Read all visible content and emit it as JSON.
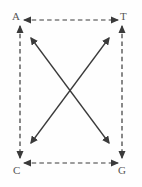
{
  "figure": {
    "width": 142,
    "height": 187,
    "background_color": "#fefefe",
    "stroke_color": "#3a3a3a",
    "label_color": "#555555"
  },
  "nodes": [
    {
      "id": "a",
      "label": "A",
      "position": "top-left",
      "x": 20,
      "y": 24
    },
    {
      "id": "t",
      "label": "T",
      "position": "top-right",
      "x": 122,
      "y": 24
    },
    {
      "id": "c",
      "label": "C",
      "position": "bottom-left",
      "x": 20,
      "y": 161
    },
    {
      "id": "g",
      "label": "G",
      "position": "bottom-right",
      "x": 122,
      "y": 161
    }
  ],
  "edges": [
    {
      "id": "edge-top",
      "from": "a",
      "to": "t",
      "style": "dashed",
      "arrowheads": "both",
      "x1": 24,
      "y1": 20,
      "x2": 118,
      "y2": 20
    },
    {
      "id": "edge-bottom",
      "from": "c",
      "to": "g",
      "style": "dashed",
      "arrowheads": "both",
      "x1": 24,
      "y1": 163,
      "x2": 118,
      "y2": 163
    },
    {
      "id": "edge-left",
      "from": "a",
      "to": "c",
      "style": "dashed",
      "arrowheads": "both",
      "x1": 20,
      "y1": 25,
      "x2": 20,
      "y2": 160
    },
    {
      "id": "edge-right",
      "from": "t",
      "to": "g",
      "style": "dashed",
      "arrowheads": "both",
      "x1": 122,
      "y1": 25,
      "x2": 122,
      "y2": 160
    },
    {
      "id": "diagonal-a-g",
      "from": "a",
      "to": "g",
      "style": "solid",
      "arrowheads": "both",
      "x1": 30,
      "y1": 37,
      "x2": 110,
      "y2": 144
    },
    {
      "id": "diagonal-c-t",
      "from": "c",
      "to": "t",
      "style": "solid",
      "arrowheads": "both",
      "x1": 30,
      "y1": 144,
      "x2": 110,
      "y2": 37
    }
  ]
}
